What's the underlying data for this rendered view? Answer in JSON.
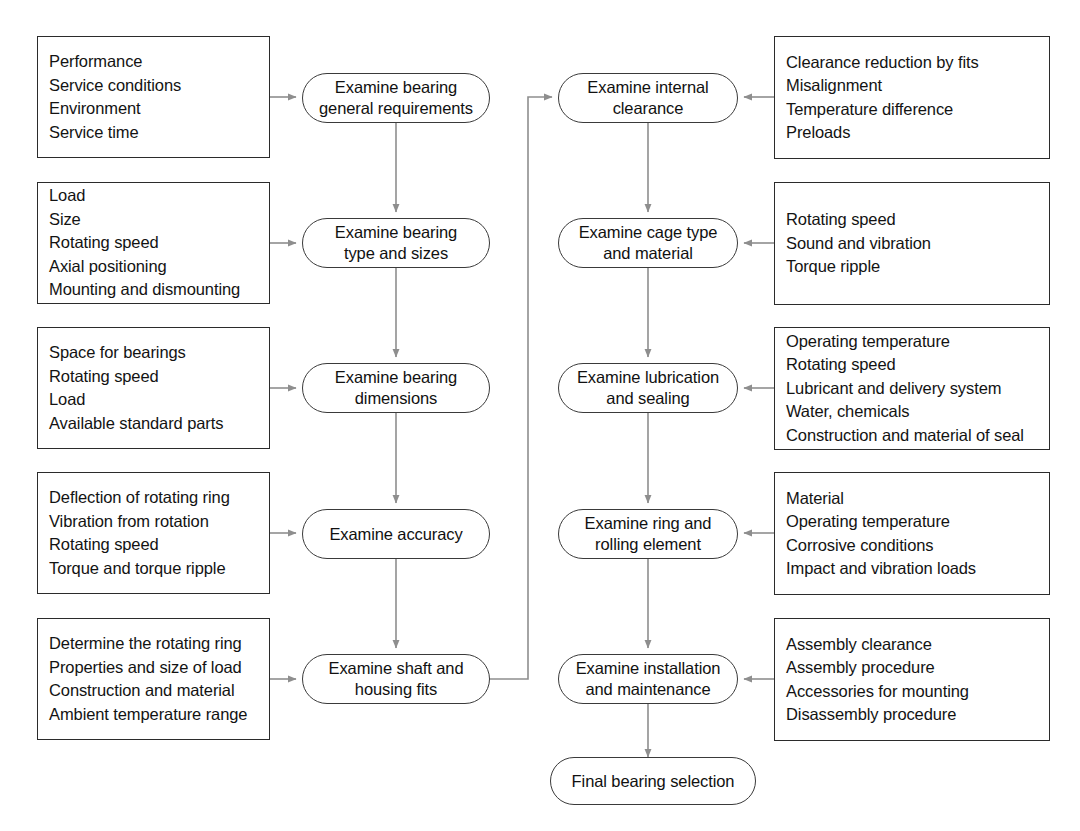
{
  "diagram": {
    "colors": {
      "box_border": "#2b2b2b",
      "node_border": "#3a3a3a",
      "connector": "#8a8a8a",
      "text": "#131313",
      "background": "#ffffff"
    },
    "left_column": {
      "input_boxes": [
        {
          "id": "general-requirements-inputs",
          "lines": [
            "Performance",
            "Service conditions",
            "Environment",
            "Service time"
          ]
        },
        {
          "id": "type-and-sizes-inputs",
          "lines": [
            "Load",
            "Size",
            "Rotating speed",
            "Axial positioning",
            "Mounting and dismounting"
          ]
        },
        {
          "id": "dimensions-inputs",
          "lines": [
            "Space for bearings",
            "Rotating speed",
            "Load",
            "Available standard parts"
          ]
        },
        {
          "id": "accuracy-inputs",
          "lines": [
            "Deflection of rotating ring",
            "Vibration from rotation",
            "Rotating speed",
            "Torque and torque ripple"
          ]
        },
        {
          "id": "shaft-housing-fits-inputs",
          "lines": [
            "Determine the rotating ring",
            "Properties and size of load",
            "Construction and material",
            "Ambient temperature range"
          ]
        }
      ],
      "nodes": [
        {
          "id": "examine-bearing-general-requirements",
          "label": "Examine bearing\ngeneral requirements"
        },
        {
          "id": "examine-bearing-type-and-sizes",
          "label": "Examine bearing\ntype and sizes"
        },
        {
          "id": "examine-bearing-dimensions",
          "label": "Examine bearing\ndimensions"
        },
        {
          "id": "examine-accuracy",
          "label": "Examine accuracy"
        },
        {
          "id": "examine-shaft-and-housing-fits",
          "label": "Examine shaft and\nhousing fits"
        }
      ]
    },
    "right_column": {
      "nodes": [
        {
          "id": "examine-internal-clearance",
          "label": "Examine internal\nclearance"
        },
        {
          "id": "examine-cage-type-and-material",
          "label": "Examine cage type\nand material"
        },
        {
          "id": "examine-lubrication-and-sealing",
          "label": "Examine lubrication\nand sealing"
        },
        {
          "id": "examine-ring-and-rolling-element",
          "label": "Examine ring and\nrolling element"
        },
        {
          "id": "examine-installation-and-maintenance",
          "label": "Examine installation\nand maintenance"
        }
      ],
      "input_boxes": [
        {
          "id": "internal-clearance-inputs",
          "lines": [
            "Clearance reduction by fits",
            "Misalignment",
            "Temperature difference",
            "Preloads"
          ]
        },
        {
          "id": "cage-type-inputs",
          "lines": [
            "Rotating speed",
            "Sound and vibration",
            "Torque ripple"
          ]
        },
        {
          "id": "lubrication-sealing-inputs",
          "lines": [
            "Operating temperature",
            "Rotating speed",
            "Lubricant and delivery system",
            "Water, chemicals",
            "Construction and material of seal"
          ]
        },
        {
          "id": "ring-rolling-element-inputs",
          "lines": [
            "Material",
            "Operating temperature",
            "Corrosive conditions",
            "Impact and vibration loads"
          ]
        },
        {
          "id": "installation-maintenance-inputs",
          "lines": [
            "Assembly clearance",
            "Assembly procedure",
            "Accessories for mounting",
            "Disassembly procedure"
          ]
        }
      ]
    },
    "final_node": {
      "id": "final-bearing-selection",
      "label": "Final bearing selection"
    }
  }
}
